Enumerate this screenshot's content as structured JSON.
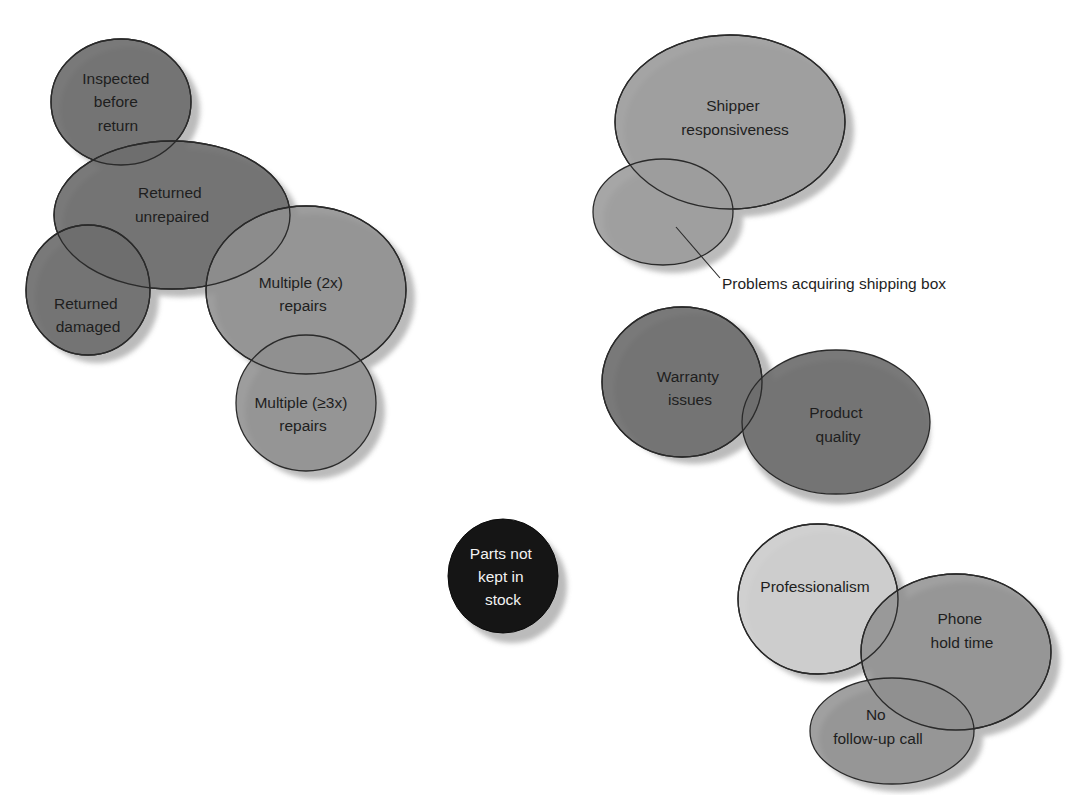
{
  "diagram": {
    "type": "overlapping-bubble-clusters",
    "colors": {
      "dark": "#6e6e6e",
      "medium": "#8f8f8f",
      "light": "#9c9c9c",
      "pale": "#cdcdcd",
      "black": "#151515",
      "shadow": "#b4b4b4",
      "outline": "#2a2a2a"
    },
    "clusters": [
      {
        "name": "repair-issues",
        "bubbles": [
          {
            "id": "inspected",
            "lines": [
              "Inspected",
              "before",
              "return"
            ],
            "shade": "dark"
          },
          {
            "id": "returned-unrepaired",
            "lines": [
              "Returned",
              "unrepaired"
            ],
            "shade": "dark"
          },
          {
            "id": "returned-damaged",
            "lines": [
              "Returned",
              "damaged"
            ],
            "shade": "dark"
          },
          {
            "id": "multiple-2x",
            "lines": [
              "Multiple (2x)",
              "repairs"
            ],
            "shade": "medium"
          },
          {
            "id": "multiple-3x",
            "lines": [
              "Multiple (≥3x)",
              "repairs"
            ],
            "shade": "medium"
          }
        ]
      },
      {
        "name": "shipping-issues",
        "bubbles": [
          {
            "id": "shipper",
            "lines": [
              "Shipper",
              "responsiveness"
            ],
            "shade": "light"
          },
          {
            "id": "shipping-box",
            "lines": [],
            "shade": "light"
          }
        ],
        "callout": "Problems acquiring shipping box"
      },
      {
        "name": "product-issues",
        "bubbles": [
          {
            "id": "warranty",
            "lines": [
              "Warranty",
              "issues"
            ],
            "shade": "dark"
          },
          {
            "id": "product-quality",
            "lines": [
              "Product",
              "quality"
            ],
            "shade": "dark"
          }
        ]
      },
      {
        "name": "stock-issues",
        "bubbles": [
          {
            "id": "parts",
            "lines": [
              "Parts not",
              "kept in",
              "stock"
            ],
            "shade": "black"
          }
        ]
      },
      {
        "name": "service-issues",
        "bubbles": [
          {
            "id": "professionalism",
            "lines": [
              "Professionalism"
            ],
            "shade": "pale"
          },
          {
            "id": "phone-hold",
            "lines": [
              "Phone",
              "hold time"
            ],
            "shade": "medium"
          },
          {
            "id": "no-followup",
            "lines": [
              "No",
              "follow-up call"
            ],
            "shade": "medium"
          }
        ]
      }
    ]
  }
}
